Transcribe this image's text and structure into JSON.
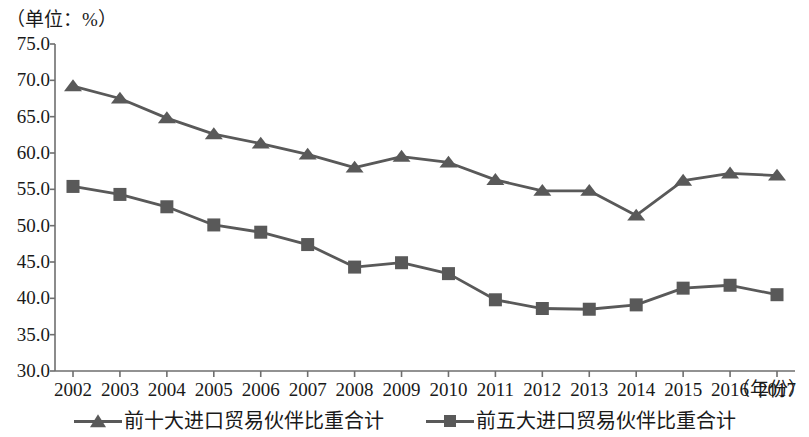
{
  "unit_caption": "（单位：%）",
  "axis": {
    "x_title": "（年份）",
    "y_ticks": [
      "75.0",
      "70.0",
      "65.0",
      "60.0",
      "55.0",
      "50.0",
      "45.0",
      "40.0",
      "35.0",
      "30.0"
    ],
    "x_ticks": [
      "2002",
      "2003",
      "2004",
      "2005",
      "2006",
      "2007",
      "2008",
      "2009",
      "2010",
      "2011",
      "2012",
      "2013",
      "2014",
      "2015",
      "2016",
      "2017"
    ]
  },
  "legend": {
    "items": [
      {
        "label": "前十大进口贸易伙伴比重合计",
        "marker": "triangle",
        "color": "#595959"
      },
      {
        "label": "前五大进口贸易伙伴比重合计",
        "marker": "square",
        "color": "#595959"
      }
    ]
  },
  "chart_data": {
    "type": "line",
    "title": "",
    "subtitle": "",
    "xlabel": "（年份）",
    "ylabel": "（单位：%）",
    "xlim": [
      2002,
      2017
    ],
    "ylim": [
      30.0,
      75.0
    ],
    "ytick_step": 5.0,
    "grid": false,
    "legend_position": "bottom",
    "x": [
      2002,
      2003,
      2004,
      2005,
      2006,
      2007,
      2008,
      2009,
      2010,
      2011,
      2012,
      2013,
      2014,
      2015,
      2016,
      2017
    ],
    "categories": [
      "2002",
      "2003",
      "2004",
      "2005",
      "2006",
      "2007",
      "2008",
      "2009",
      "2010",
      "2011",
      "2012",
      "2013",
      "2014",
      "2015",
      "2016",
      "2017"
    ],
    "series": [
      {
        "name": "前十大进口贸易伙伴比重合计",
        "marker": "triangle",
        "color": "#595959",
        "values": [
          69.2,
          67.5,
          64.8,
          62.6,
          61.3,
          59.8,
          58.0,
          59.5,
          58.7,
          56.3,
          54.8,
          54.8,
          51.4,
          56.2,
          57.2,
          56.9
        ]
      },
      {
        "name": "前五大进口贸易伙伴比重合计",
        "marker": "square",
        "color": "#595959",
        "values": [
          55.4,
          54.3,
          52.6,
          50.1,
          49.1,
          47.4,
          44.3,
          44.9,
          43.4,
          39.8,
          38.6,
          38.5,
          39.1,
          41.4,
          41.8,
          40.5
        ]
      }
    ]
  }
}
